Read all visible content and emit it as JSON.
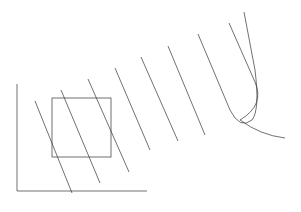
{
  "diagram": {
    "type": "contour-survey",
    "stroke_color": "#333333",
    "background": "#ffffff",
    "contour_labels": [
      "Y=210",
      "Y=220",
      "Y=230",
      "Y=240",
      "Y=250",
      "Y=260",
      "Y=270",
      "Y=270",
      "Y=280"
    ],
    "points": [
      "1",
      "2",
      "3",
      "4",
      "5"
    ]
  }
}
